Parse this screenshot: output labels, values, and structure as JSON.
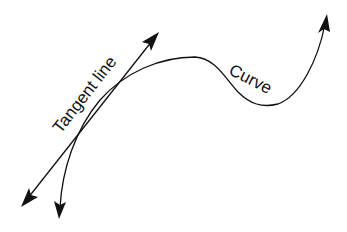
{
  "diagram": {
    "title": "",
    "labels": {
      "tangent": "Tangent line",
      "curve": "Curve"
    },
    "colors": {
      "stroke": "#111111",
      "background": "#ffffff"
    },
    "elements": [
      {
        "type": "line",
        "name": "tangent-line",
        "arrows": "both",
        "from": [
          21,
          207
        ],
        "to": [
          159,
          32
        ]
      },
      {
        "type": "curve",
        "name": "curve",
        "arrows": "both",
        "start": [
          59,
          218
        ],
        "end": [
          327,
          14
        ]
      }
    ]
  }
}
